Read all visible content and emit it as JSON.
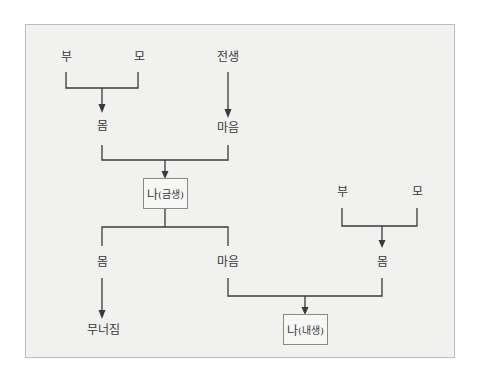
{
  "diagram": {
    "colors": {
      "background": "#f1f1f0",
      "frame_border": "#bdbdbd",
      "line": "#3a3a3a",
      "text": "#3a3a3a",
      "box_border": "#8a8a8a"
    },
    "present_life": {
      "father": "부",
      "mother": "모",
      "body": "몸",
      "past_life": "전생",
      "mind": "마음",
      "self_box": {
        "main": "나",
        "sub": "(금생)"
      }
    },
    "after_split": {
      "body": "몸",
      "mind": "마음",
      "collapse": "무너짐"
    },
    "next_life": {
      "father": "부",
      "mother": "모",
      "body": "몸",
      "self_box": {
        "main": "나",
        "sub": "(내생)"
      }
    }
  }
}
